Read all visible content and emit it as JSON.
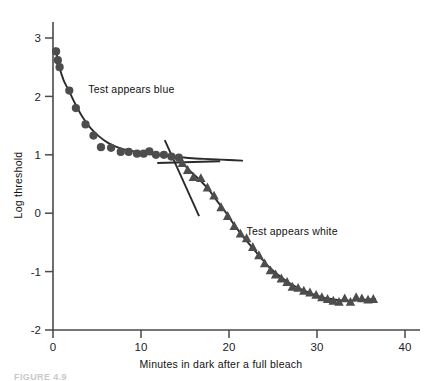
{
  "chart_data": {
    "type": "scatter",
    "title": "",
    "xlabel": "Minutes in dark after a full bleach",
    "ylabel": "Log threshold",
    "xlim": [
      0,
      42
    ],
    "ylim": [
      -2,
      3.2
    ],
    "xticks": [
      0,
      10,
      20,
      30,
      40
    ],
    "xtick_labels": [
      "0",
      "10",
      "20",
      "30",
      "40"
    ],
    "yticks": [
      3,
      2,
      1,
      0,
      -1,
      -2
    ],
    "ytick_labels": [
      "3",
      "2",
      "1",
      "0",
      "-1",
      "-2"
    ],
    "grid": false,
    "legend_position": "none",
    "annotations": [
      {
        "text": "Test appears blue",
        "x": 4.0,
        "y": 2.05
      },
      {
        "text": "Test appears white",
        "x": 22.0,
        "y": -0.38
      }
    ],
    "series": [
      {
        "name": "Cone branch (test appears blue)",
        "marker": "circle",
        "color": "#4d4d4d",
        "points": [
          [
            0.35,
            2.77
          ],
          [
            0.55,
            2.62
          ],
          [
            0.75,
            2.5
          ],
          [
            1.85,
            2.1
          ],
          [
            2.6,
            1.8
          ],
          [
            3.7,
            1.52
          ],
          [
            4.6,
            1.33
          ],
          [
            5.45,
            1.13
          ],
          [
            6.6,
            1.12
          ],
          [
            7.7,
            1.05
          ],
          [
            8.6,
            1.05
          ],
          [
            9.55,
            1.02
          ],
          [
            10.3,
            1.02
          ],
          [
            10.95,
            1.06
          ],
          [
            11.7,
            1.0
          ],
          [
            12.6,
            1.0
          ],
          [
            13.45,
            0.97
          ],
          [
            14.3,
            0.95
          ]
        ]
      },
      {
        "name": "Rod branch (test appears white)",
        "marker": "triangle",
        "color": "#4d4d4d",
        "points": [
          [
            14.7,
            0.86
          ],
          [
            15.3,
            0.74
          ],
          [
            15.95,
            0.62
          ],
          [
            16.8,
            0.6
          ],
          [
            17.55,
            0.44
          ],
          [
            18.3,
            0.3
          ],
          [
            19.1,
            0.1
          ],
          [
            19.85,
            -0.05
          ],
          [
            20.6,
            -0.22
          ],
          [
            21.3,
            -0.35
          ],
          [
            22.0,
            -0.43
          ],
          [
            22.7,
            -0.58
          ],
          [
            23.4,
            -0.72
          ],
          [
            24.05,
            -0.86
          ],
          [
            24.7,
            -0.98
          ],
          [
            25.3,
            -1.05
          ],
          [
            25.95,
            -1.12
          ],
          [
            26.6,
            -1.18
          ],
          [
            27.2,
            -1.26
          ],
          [
            27.85,
            -1.28
          ],
          [
            28.5,
            -1.33
          ],
          [
            29.2,
            -1.36
          ],
          [
            29.9,
            -1.4
          ],
          [
            30.55,
            -1.44
          ],
          [
            31.2,
            -1.47
          ],
          [
            31.85,
            -1.5
          ],
          [
            32.5,
            -1.52
          ],
          [
            33.15,
            -1.46
          ],
          [
            33.8,
            -1.52
          ],
          [
            34.45,
            -1.44
          ],
          [
            35.1,
            -1.46
          ],
          [
            35.8,
            -1.48
          ],
          [
            36.4,
            -1.47
          ]
        ]
      }
    ],
    "fit_curves": [
      {
        "name": "cone-branch-fit",
        "points": [
          [
            0.3,
            2.82
          ],
          [
            0.7,
            2.52
          ],
          [
            1.2,
            2.28
          ],
          [
            1.8,
            2.1
          ],
          [
            2.5,
            1.88
          ],
          [
            3.3,
            1.66
          ],
          [
            4.2,
            1.47
          ],
          [
            5.2,
            1.32
          ],
          [
            6.3,
            1.2
          ],
          [
            7.5,
            1.12
          ],
          [
            8.8,
            1.07
          ],
          [
            10.2,
            1.03
          ],
          [
            11.6,
            1.0
          ],
          [
            13.0,
            0.98
          ],
          [
            14.4,
            0.96
          ],
          [
            15.8,
            0.94
          ],
          [
            17.2,
            0.93
          ],
          [
            18.6,
            0.92
          ],
          [
            20.0,
            0.91
          ],
          [
            21.5,
            0.9
          ]
        ]
      },
      {
        "name": "rod-branch-fit",
        "points": [
          [
            14.6,
            0.88
          ],
          [
            15.6,
            0.72
          ],
          [
            16.6,
            0.58
          ],
          [
            17.6,
            0.42
          ],
          [
            18.6,
            0.22
          ],
          [
            19.6,
            0.02
          ],
          [
            20.6,
            -0.2
          ],
          [
            21.6,
            -0.4
          ],
          [
            22.6,
            -0.58
          ],
          [
            23.6,
            -0.76
          ],
          [
            24.6,
            -0.93
          ],
          [
            25.6,
            -1.06
          ],
          [
            26.6,
            -1.17
          ],
          [
            27.6,
            -1.26
          ],
          [
            28.6,
            -1.33
          ],
          [
            29.6,
            -1.39
          ],
          [
            30.6,
            -1.44
          ],
          [
            31.6,
            -1.47
          ],
          [
            32.6,
            -1.49
          ],
          [
            33.6,
            -1.5
          ],
          [
            34.6,
            -1.49
          ],
          [
            35.6,
            -1.48
          ],
          [
            36.6,
            -1.47
          ]
        ]
      }
    ],
    "marker_lines": [
      {
        "name": "steep-crossing-line",
        "x1": 12.7,
        "y1": 1.25,
        "x2": 16.6,
        "y2": -0.05
      },
      {
        "name": "horizontal-crossing-line",
        "x1": 11.85,
        "y1": 0.86,
        "x2": 19.0,
        "y2": 0.89
      }
    ]
  },
  "caption": {
    "text": "FIGURE 4.9"
  }
}
